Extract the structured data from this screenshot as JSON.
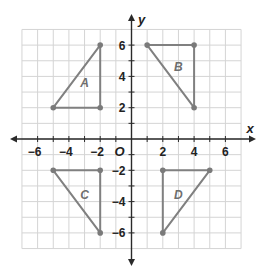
{
  "chart_data": {
    "type": "scatter",
    "title": "",
    "xlabel": "x",
    "ylabel": "y",
    "xlim": [
      -7,
      7
    ],
    "ylim": [
      -7,
      7
    ],
    "grid": true,
    "x_ticks": [
      -6,
      -4,
      -2,
      2,
      4,
      6
    ],
    "y_ticks": [
      6,
      4,
      2,
      -2,
      -4,
      -6
    ],
    "origin_label": "O",
    "series": [
      {
        "name": "A",
        "type": "triangle",
        "points": [
          [
            -5,
            2
          ],
          [
            -2,
            6
          ],
          [
            -2,
            2
          ]
        ],
        "label_pos": [
          -3,
          3.6
        ]
      },
      {
        "name": "B",
        "type": "triangle",
        "points": [
          [
            1,
            6
          ],
          [
            4,
            6
          ],
          [
            4,
            2
          ]
        ],
        "label_pos": [
          3,
          4.6
        ]
      },
      {
        "name": "C",
        "type": "triangle",
        "points": [
          [
            -5,
            -2
          ],
          [
            -2,
            -2
          ],
          [
            -2,
            -6
          ]
        ],
        "label_pos": [
          -3,
          -3.6
        ]
      },
      {
        "name": "D",
        "type": "triangle",
        "points": [
          [
            2,
            -2
          ],
          [
            5,
            -2
          ],
          [
            2,
            -6
          ]
        ],
        "label_pos": [
          3,
          -3.6
        ]
      }
    ]
  },
  "colors": {
    "grid": "#d4d4d4",
    "axis": "#2a2a2a",
    "shape": "#808080",
    "vertex": "#7a7a7a",
    "label": "#6e6e6e"
  }
}
